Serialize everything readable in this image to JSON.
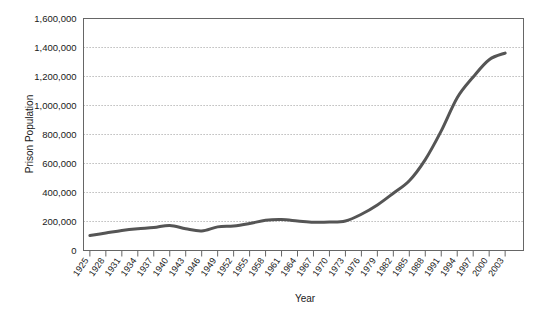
{
  "chart_data": {
    "type": "line",
    "title": "",
    "xlabel": "Year",
    "ylabel": "Prison Population",
    "ylim": [
      0,
      1600000
    ],
    "xlim": [
      1925,
      2003
    ],
    "grid": true,
    "legend": false,
    "legend_position": "none",
    "line_color": "#555555",
    "ytick_labels": [
      "1,600,000",
      "1,400,000",
      "1,200,000",
      "1,000,000",
      "800,000",
      "600,000",
      "400,000",
      "200,000",
      "0"
    ],
    "ytick_values": [
      1600000,
      1400000,
      1200000,
      1000000,
      800000,
      600000,
      400000,
      200000,
      0
    ],
    "categories": [
      "1925",
      "1928",
      "1931",
      "1934",
      "1937",
      "1940",
      "1943",
      "1946",
      "1949",
      "1952",
      "1955",
      "1958",
      "1961",
      "1964",
      "1967",
      "1970",
      "1973",
      "1976",
      "1979",
      "1982",
      "1985",
      "1988",
      "1991",
      "1994",
      "1997",
      "2000",
      "2003"
    ],
    "series": [
      {
        "name": "Prison Population",
        "values": [
          103000,
          120000,
          138000,
          150000,
          158000,
          173000,
          150000,
          135000,
          163000,
          169000,
          186000,
          208000,
          213000,
          204000,
          195000,
          196000,
          204000,
          250000,
          314000,
          395000,
          481000,
          627000,
          825000,
          1054000,
          1197000,
          1316000,
          1362000
        ]
      }
    ]
  }
}
